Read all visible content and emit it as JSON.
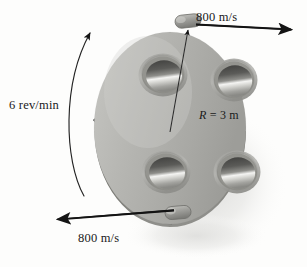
{
  "figure": {
    "name": "rotating-sprinkler-disk-diagram",
    "type": "engineering-mechanics-illustration",
    "background_color": "#fdfdfc"
  },
  "labels": {
    "top_speed": "800 m/s",
    "bottom_speed": "800 m/s",
    "rotation_rate": "6 rev/min",
    "radius_prefix": "R",
    "radius_value": " = 3 m",
    "radius_full": "R = 3 m"
  },
  "colors": {
    "disk_face": "#b4b4b0",
    "disk_face_light": "#c9c9c5",
    "disk_face_dark": "#8e8e8a",
    "disk_rim": "#7e7e7a",
    "hole_ring": "#9a9a96",
    "hole_dark": "#4a4a48",
    "hole_highlight": "#f2f2f0",
    "cone_dark": "#3b3b39",
    "nozzle": "#9c9c98",
    "arrow": "#141414",
    "shadow": "#e4e4e2",
    "text": "#1a1a1a"
  },
  "geometry": {
    "disk_center_x": 170,
    "disk_center_y": 130,
    "disk_radius_x": 76,
    "disk_radius_y": 97,
    "holes": [
      {
        "name": "hole-top-left",
        "cx": 163,
        "cy": 75,
        "rx": 21,
        "ry": 18
      },
      {
        "name": "hole-top-right",
        "cx": 234,
        "cy": 80,
        "rx": 20,
        "ry": 18
      },
      {
        "name": "hole-bottom-left",
        "cx": 166,
        "cy": 172,
        "rx": 21,
        "ry": 18
      },
      {
        "name": "hole-bottom-right",
        "cx": 237,
        "cy": 172,
        "rx": 20,
        "ry": 18
      }
    ],
    "nozzles": [
      {
        "name": "nozzle-top",
        "cx": 188,
        "cy": 22
      },
      {
        "name": "nozzle-bottom",
        "cx": 178,
        "cy": 213
      }
    ],
    "arrows": [
      {
        "name": "velocity-arrow-top",
        "direction": "right",
        "x1": 196,
        "y1": 24,
        "x2": 301,
        "y2": 29
      },
      {
        "name": "velocity-arrow-bottom",
        "direction": "left",
        "x1": 172,
        "y1": 210,
        "x2": 45,
        "y2": 220
      }
    ],
    "radius_line": {
      "name": "radius-leader",
      "x1": 170,
      "y1": 130,
      "x2": 188,
      "y2": 28
    },
    "rotation_arc": {
      "name": "rotation-arc",
      "start_x": 84,
      "start_y": 193,
      "end_x": 90,
      "end_y": 30
    }
  }
}
